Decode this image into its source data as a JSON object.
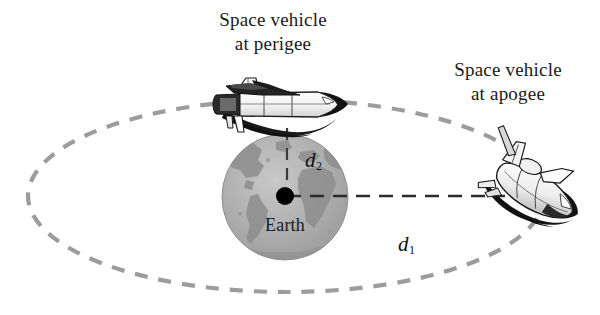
{
  "figure": {
    "background_color": "#ffffff",
    "orbit_color": "#9c9c9c",
    "measure_line_color": "#2b2b2b",
    "earth_color": "#a8a8a8",
    "earth_land_color": "#8c8c8c",
    "center_dot_color": "#000000",
    "text_color": "#1a1a1a"
  },
  "labels": {
    "perigee": {
      "line1": "Space vehicle",
      "line2": "at perigee"
    },
    "apogee": {
      "line1": "Space vehicle",
      "line2": "at apogee"
    },
    "earth": "Earth",
    "d1": "d",
    "d1_sub": "1",
    "d2": "d",
    "d2_sub": "2"
  },
  "objects": {
    "earth_name": "earth-sphere",
    "center_name": "earth-center-dot",
    "orbit_name": "orbit-ellipse",
    "shuttle_perigee_name": "space-shuttle-perigee",
    "shuttle_apogee_name": "space-shuttle-apogee",
    "d1_line_name": "distance-line-d1",
    "d2_line_name": "distance-line-d2"
  },
  "geometry": {
    "orbit_center_x": 286,
    "orbit_center_y": 196,
    "orbit_radius_x": 258,
    "orbit_radius_y": 96,
    "earth_center_x": 285,
    "earth_center_y": 197,
    "earth_radius": 63,
    "d1_from_x": 287,
    "d1_to_x": 505,
    "d1_y": 196,
    "d2_x": 287,
    "d2_from_y": 130,
    "d2_to_y": 192
  }
}
